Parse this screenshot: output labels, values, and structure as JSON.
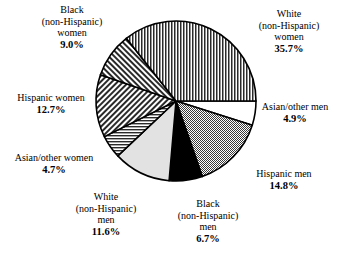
{
  "chart_data": {
    "type": "pie",
    "title": "",
    "subtitle": "",
    "xlabel": "",
    "ylabel": "",
    "legend_position": "none",
    "grid": false,
    "labels_outside": true,
    "total_percent": "100.1",
    "categories": [
      "White (non-Hispanic) women",
      "Asian/other men",
      "Hispanic men",
      "Black (non-Hispanic) men",
      "White (non-Hispanic) men",
      "Asian/other women",
      "Hispanic women",
      "Black (non-Hispanic) women"
    ],
    "values": [
      35.7,
      4.9,
      14.8,
      6.7,
      11.6,
      4.7,
      12.7,
      9.0
    ],
    "slices": [
      {
        "id": "white-women",
        "name": "White\n(non-Hispanic)\nwomen",
        "line1": "White",
        "line2": "(non-Hispanic)",
        "line3": "women",
        "value": 35.7,
        "percent_label": "35.7%",
        "fill": "vertical-stripes",
        "color": "#ffffff",
        "stroke": "#000000"
      },
      {
        "id": "asian-other-men",
        "name": "Asian/other men",
        "line1": "Asian/other men",
        "line2": "",
        "line3": "",
        "value": 4.9,
        "percent_label": "4.9%",
        "fill": "solid-white",
        "color": "#ffffff",
        "stroke": "#000000"
      },
      {
        "id": "hispanic-men",
        "name": "Hispanic men",
        "line1": "Hispanic men",
        "line2": "",
        "line3": "",
        "value": 14.8,
        "percent_label": "14.8%",
        "fill": "checker-gray",
        "color": "#a8a8a8",
        "stroke": "#000000"
      },
      {
        "id": "black-men",
        "name": "Black\n(non-Hispanic)\nmen",
        "line1": "Black",
        "line2": "(non-Hispanic)",
        "line3": "men",
        "value": 6.7,
        "percent_label": "6.7%",
        "fill": "solid-black",
        "color": "#000000",
        "stroke": "#000000"
      },
      {
        "id": "white-men",
        "name": "White\n(non-Hispanic)\nmen",
        "line1": "White",
        "line2": "(non-Hispanic)",
        "line3": "men",
        "value": 11.6,
        "percent_label": "11.6%",
        "fill": "light-gray",
        "color": "#e2e2e2",
        "stroke": "#000000"
      },
      {
        "id": "asian-other-women",
        "name": "Asian/other women",
        "line1": "Asian/other women",
        "line2": "",
        "line3": "",
        "value": 4.7,
        "percent_label": "4.7%",
        "fill": "horizontal-stripes",
        "color": "#ffffff",
        "stroke": "#000000"
      },
      {
        "id": "hispanic-women",
        "name": "Hispanic women",
        "line1": "Hispanic women",
        "line2": "",
        "line3": "",
        "value": 12.7,
        "percent_label": "12.7%",
        "fill": "diagonal-down",
        "color": "#ffffff",
        "stroke": "#000000"
      },
      {
        "id": "black-women",
        "name": "Black\n(non-Hispanic)\nwomen",
        "line1": "Black",
        "line2": "(non-Hispanic)",
        "line3": "women",
        "value": 9.0,
        "percent_label": "9.0%",
        "fill": "diagonal-up",
        "color": "#ffffff",
        "stroke": "#000000"
      }
    ]
  }
}
